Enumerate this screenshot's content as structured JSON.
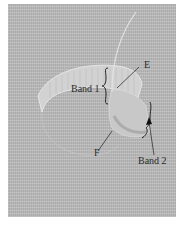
{
  "figure": {
    "labels": {
      "band1": "Band 1",
      "band2": "Band 2",
      "e": "E",
      "f": "F"
    },
    "colors": {
      "background_fabric": "#b9b9b9",
      "stitch_band": "#cfcfcf",
      "stitch_shadow": "#a3a3a3",
      "label_text": "#2a2a2a",
      "border": "#ffffff"
    }
  }
}
